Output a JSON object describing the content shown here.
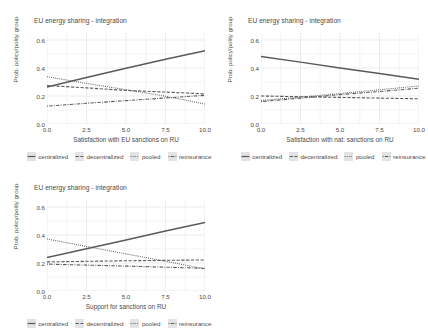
{
  "figure": {
    "panel_count": 3,
    "background": "#ffffff",
    "text_color": "#4a4a4a",
    "grid_color": "#ededed",
    "line_color": "#595959"
  },
  "legend": {
    "items": [
      {
        "label": "centralized",
        "style": "solid"
      },
      {
        "label": "decentralized",
        "style": "dashed"
      },
      {
        "label": "pooled",
        "style": "dotted"
      },
      {
        "label": "reinsurance",
        "style": "dotdash"
      }
    ]
  },
  "axes": {
    "y_title": "Prob. policy/polity group",
    "y_ticks": [
      "0.0",
      "0.2",
      "0.4",
      "0.6"
    ],
    "y_values": [
      0.0,
      0.2,
      0.4,
      0.6
    ],
    "ylim": [
      0.0,
      0.65
    ],
    "x_ticks": [
      "0.0",
      "2.5",
      "5.0",
      "7.5",
      "10.0"
    ],
    "x_values": [
      0.0,
      2.5,
      5.0,
      7.5,
      10.0
    ],
    "xlim": [
      0.0,
      10.0
    ]
  },
  "chart_data": [
    {
      "type": "line",
      "title": "EU energy sharing - integration",
      "xlabel": "Satisfaction with EU sanctions on RU",
      "ylabel": "Prob. policy/polity group",
      "xlim": [
        0,
        10
      ],
      "ylim": [
        0,
        0.65
      ],
      "x": [
        0,
        2.5,
        5,
        7.5,
        10
      ],
      "grid": true,
      "legend_position": "bottom",
      "series": [
        {
          "name": "centralized",
          "style": "solid",
          "values": [
            0.265,
            0.332,
            0.398,
            0.462,
            0.523
          ]
        },
        {
          "name": "decentralized",
          "style": "dashed",
          "values": [
            0.275,
            0.258,
            0.24,
            0.228,
            0.215
          ]
        },
        {
          "name": "pooled",
          "style": "dotted",
          "values": [
            0.338,
            0.29,
            0.245,
            0.198,
            0.142
          ]
        },
        {
          "name": "reinsurance",
          "style": "dotdash",
          "values": [
            0.128,
            0.148,
            0.167,
            0.186,
            0.205
          ]
        }
      ]
    },
    {
      "type": "line",
      "title": "EU energy sharing - integration",
      "xlabel": "Satisfaction with nat. sanctions on RU",
      "ylabel": "Prob. policy/polity group",
      "xlim": [
        0,
        10
      ],
      "ylim": [
        0,
        0.65
      ],
      "x": [
        0,
        2.5,
        5,
        7.5,
        10
      ],
      "grid": true,
      "legend_position": "bottom",
      "series": [
        {
          "name": "centralized",
          "style": "solid",
          "values": [
            0.482,
            0.442,
            0.4,
            0.36,
            0.32
          ]
        },
        {
          "name": "decentralized",
          "style": "dashed",
          "values": [
            0.2,
            0.195,
            0.19,
            0.185,
            0.18
          ]
        },
        {
          "name": "pooled",
          "style": "dotted",
          "values": [
            0.168,
            0.192,
            0.218,
            0.244,
            0.272
          ]
        },
        {
          "name": "reinsurance",
          "style": "dotdash",
          "values": [
            0.16,
            0.185,
            0.21,
            0.232,
            0.256
          ]
        }
      ]
    },
    {
      "type": "line",
      "title": "EU energy sharing - integration",
      "xlabel": "Support for sanctions on RU",
      "ylabel": "Prob. policy/polity group",
      "xlim": [
        0,
        10
      ],
      "ylim": [
        0,
        0.65
      ],
      "x": [
        0,
        2.5,
        5,
        7.5,
        10
      ],
      "grid": true,
      "legend_position": "bottom",
      "series": [
        {
          "name": "centralized",
          "style": "solid",
          "values": [
            0.24,
            0.302,
            0.365,
            0.428,
            0.49
          ]
        },
        {
          "name": "decentralized",
          "style": "dashed",
          "values": [
            0.208,
            0.212,
            0.216,
            0.219,
            0.222
          ]
        },
        {
          "name": "pooled",
          "style": "dotted",
          "values": [
            0.372,
            0.318,
            0.265,
            0.212,
            0.158
          ]
        },
        {
          "name": "reinsurance",
          "style": "dotdash",
          "values": [
            0.192,
            0.185,
            0.178,
            0.17,
            0.162
          ]
        }
      ]
    }
  ]
}
